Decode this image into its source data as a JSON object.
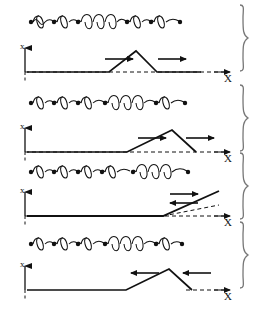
{
  "figure": {
    "width": 262,
    "height": 320,
    "background_color": "#ffffff",
    "stroke_color": "#111111",
    "panel_count": 4
  },
  "axis_labels": {
    "vertical": "x",
    "horizontal": "X"
  },
  "panels": [
    {
      "id": "panel-1",
      "index": 1,
      "chain": {
        "bead_count": 6,
        "spring_count": 5,
        "spring_states": [
          "compressed",
          "compressed",
          "stretched",
          "compressed",
          "compressed"
        ],
        "stretched_spring_index": 3
      },
      "profile": {
        "shape": "triangular-pulse-up",
        "direction": "right",
        "peak_position_pct": 62,
        "arrows": [
          {
            "name": "arrow-left-of-peak",
            "direction": "right",
            "x_pct": 46
          },
          {
            "name": "arrow-right-of-peak",
            "direction": "right",
            "x_pct": 77
          }
        ]
      },
      "vertical_axis_label": "x",
      "horizontal_axis_label": "X",
      "brace": "right-curly-brace"
    },
    {
      "id": "panel-2",
      "index": 2,
      "chain": {
        "bead_count": 6,
        "spring_count": 5,
        "spring_states": [
          "compressed",
          "compressed",
          "compressed",
          "stretched",
          "compressed"
        ],
        "stretched_spring_index": 4
      },
      "profile": {
        "shape": "triangular-pulse-up",
        "direction": "right",
        "peak_position_pct": 76,
        "arrows": [
          {
            "name": "arrow-left-of-peak",
            "direction": "right",
            "x_pct": 62
          },
          {
            "name": "arrow-right-of-peak",
            "direction": "right",
            "x_pct": 88
          }
        ]
      },
      "vertical_axis_label": "x",
      "horizontal_axis_label": "X",
      "brace": "right-curly-brace"
    },
    {
      "id": "panel-3",
      "index": 3,
      "chain": {
        "bead_count": 6,
        "spring_count": 5,
        "spring_states": [
          "compressed",
          "compressed",
          "compressed",
          "compressed",
          "stretched"
        ],
        "stretched_spring_index": 5
      },
      "profile": {
        "shape": "rising-ramp-at-end",
        "direction": "both",
        "peak_position_pct": 100,
        "arrows": [
          {
            "name": "arrow-upper-right",
            "direction": "right",
            "x_pct": 76
          },
          {
            "name": "arrow-lower-left",
            "direction": "left",
            "x_pct": 76
          }
        ]
      },
      "vertical_axis_label": "x",
      "horizontal_axis_label": "X",
      "brace": "right-curly-brace"
    },
    {
      "id": "panel-4",
      "index": 4,
      "chain": {
        "bead_count": 6,
        "spring_count": 5,
        "spring_states": [
          "compressed",
          "compressed",
          "compressed",
          "stretched",
          "compressed"
        ],
        "stretched_spring_index": 4
      },
      "profile": {
        "shape": "triangular-pulse-up",
        "direction": "left",
        "peak_position_pct": 76,
        "arrows": [
          {
            "name": "arrow-left-of-peak",
            "direction": "left",
            "x_pct": 58
          },
          {
            "name": "arrow-right-of-peak",
            "direction": "left",
            "x_pct": 88
          }
        ]
      },
      "vertical_axis_label": "x",
      "horizontal_axis_label": "X",
      "brace": "right-curly-brace"
    }
  ]
}
